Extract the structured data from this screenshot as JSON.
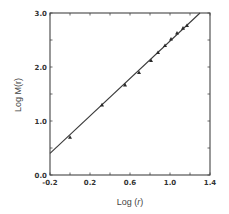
{
  "chart_data": {
    "type": "scatter",
    "title": "",
    "xlabel": "Log (r)",
    "ylabel": "Log M(r)",
    "xlim": [
      -0.2,
      1.4
    ],
    "ylim": [
      0.0,
      3.0
    ],
    "x_ticks": [
      "-0.2",
      "0.2",
      "0.6",
      "1.0",
      "1.4"
    ],
    "y_ticks": [
      "0.0",
      "1.0",
      "2.0",
      "3.0"
    ],
    "grid": false,
    "legend": null,
    "series": [
      {
        "name": "data",
        "marker": "filled-triangle",
        "x": [
          0.0,
          0.32,
          0.55,
          0.69,
          0.81,
          0.88,
          0.95,
          1.01,
          1.07,
          1.13,
          1.17
        ],
        "y": [
          0.7,
          1.3,
          1.67,
          1.9,
          2.12,
          2.27,
          2.4,
          2.52,
          2.63,
          2.72,
          2.77
        ]
      },
      {
        "name": "fit",
        "style": "solid-line",
        "x": [
          -0.2,
          1.3
        ],
        "y": [
          0.4,
          3.0
        ]
      }
    ]
  },
  "labels": {
    "xlabel_prefix": "Log (",
    "xlabel_var": "r",
    "xlabel_suffix": ")",
    "ylabel": "Log M(r)"
  },
  "colors": {
    "axis": "#444444",
    "line": "#3a3a3a",
    "marker": "#2a2a2a"
  }
}
